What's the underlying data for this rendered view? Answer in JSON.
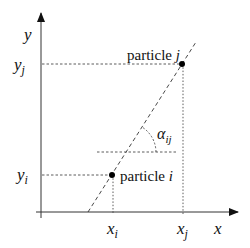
{
  "diagram": {
    "axes": {
      "x_label": "x",
      "y_label": "y"
    },
    "particles": [
      {
        "name": "particle",
        "index": "i",
        "x_label": "x",
        "x_sub": "i",
        "y_label": "y",
        "y_sub": "i"
      },
      {
        "name": "particle",
        "index": "j",
        "x_label": "x",
        "x_sub": "j",
        "y_label": "y",
        "y_sub": "j"
      }
    ],
    "angle": {
      "symbol": "α",
      "sub": "ij"
    },
    "colors": {
      "line": "#111111",
      "axis": "#333333"
    }
  }
}
